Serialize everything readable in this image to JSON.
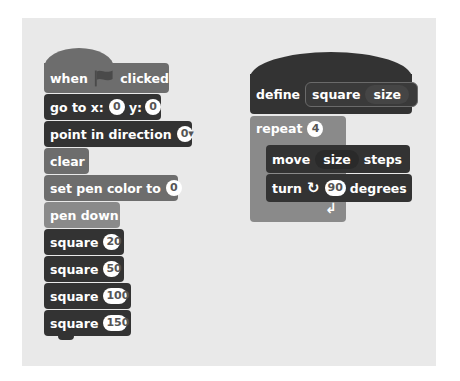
{
  "script_left": {
    "hat": {
      "when": "when",
      "flag_icon": "green-flag",
      "clicked": "clicked"
    },
    "goto": {
      "label": "go to x:",
      "x": "0",
      "ylabel": "y:",
      "y": "0"
    },
    "point": {
      "label": "point in direction",
      "value": "0",
      "dropdown": "▾"
    },
    "clear": {
      "label": "clear"
    },
    "setpen": {
      "label": "set pen color to",
      "value": "0"
    },
    "pendown": {
      "label": "pen down"
    },
    "calls": [
      {
        "label": "square",
        "value": "20"
      },
      {
        "label": "square",
        "value": "50"
      },
      {
        "label": "square",
        "value": "100"
      },
      {
        "label": "square",
        "value": "150"
      }
    ]
  },
  "script_right": {
    "define": {
      "label": "define",
      "name": "square",
      "param": "size"
    },
    "repeat": {
      "label": "repeat",
      "value": "4",
      "loop_icon": "↲"
    },
    "move": {
      "label": "move",
      "param": "size",
      "suffix": "steps"
    },
    "turn": {
      "label": "turn",
      "icon": "↻",
      "value": "90",
      "suffix": "degrees"
    }
  }
}
